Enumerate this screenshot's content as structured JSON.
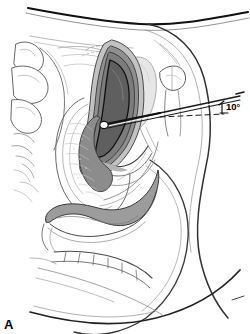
{
  "figure": {
    "panel_label": "A",
    "background_color": "#ffffff",
    "width": 250,
    "height": 334
  },
  "annotations": {
    "angle_label": "10°",
    "angle_value": 10,
    "angle_unit": "degrees",
    "reference_line_style": "dashed",
    "instrument_line_style": "solid"
  },
  "palette": {
    "outline": "#1a1a1a",
    "thin_outline": "#555555",
    "faint_outline": "#8d8d8d",
    "myometrium": "#8c8c8c",
    "myometrium_outer": "#b8b8b8",
    "endometrial_cavity": "#6e6e6e",
    "rectum": "#999999",
    "bladder": "#e3e3e3",
    "vagina_wall": "#f2f2f2",
    "soft_tissue": "#ffffff",
    "bone": "#ffffff"
  },
  "structures": [
    {
      "id": "abdominal-wall",
      "label": "Abdominal wall",
      "fill": "none"
    },
    {
      "id": "body-contour",
      "label": "Body contour",
      "fill": "none"
    },
    {
      "id": "sacrum",
      "label": "Sacrum",
      "fill": "#ffffff"
    },
    {
      "id": "coccyx",
      "label": "Coccyx",
      "fill": "#ffffff"
    },
    {
      "id": "pubic-symphysis",
      "label": "Pubic symphysis",
      "fill": "#ffffff"
    },
    {
      "id": "bladder",
      "label": "Urinary bladder",
      "fill": "#e3e3e3"
    },
    {
      "id": "uterus-myometrium",
      "label": "Uterine myometrium",
      "fill": "#8c8c8c"
    },
    {
      "id": "endometrial-cavity",
      "label": "Endometrial cavity",
      "fill": "#6e6e6e"
    },
    {
      "id": "cervix",
      "label": "Cervix",
      "fill": "#b8b8b8"
    },
    {
      "id": "vaginal-canal",
      "label": "Vaginal canal",
      "fill": "#f2f2f2"
    },
    {
      "id": "rectum",
      "label": "Rectum",
      "fill": "#999999"
    },
    {
      "id": "uterine-sound",
      "label": "Uterine sound / catheter",
      "fill": "#ffffff"
    }
  ]
}
